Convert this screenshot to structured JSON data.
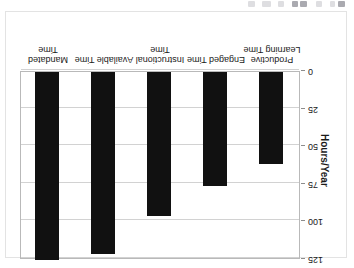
{
  "toolbar": {
    "visible": true,
    "note": "partially cropped application toolbar strip",
    "icons": [
      {
        "name": "toolbar-icon-1",
        "x": 248,
        "w": 7,
        "dark": false
      },
      {
        "name": "toolbar-icon-2",
        "x": 262,
        "w": 9,
        "dark": false
      },
      {
        "name": "toolbar-icon-3",
        "x": 278,
        "w": 6,
        "dark": false
      },
      {
        "name": "toolbar-icon-4",
        "x": 292,
        "w": 6,
        "dark": true
      },
      {
        "name": "toolbar-icon-5",
        "x": 300,
        "w": 7,
        "dark": true
      },
      {
        "name": "toolbar-icon-6",
        "x": 316,
        "w": 6,
        "dark": false
      },
      {
        "name": "toolbar-icon-7",
        "x": 330,
        "w": 5,
        "dark": false
      },
      {
        "name": "toolbar-icon-8",
        "x": 338,
        "w": 7,
        "dark": true
      }
    ]
  },
  "colors": {
    "bar": "#111111",
    "gridline": "#d2d2d2",
    "frame": "#b9b9b9",
    "card_border": "#e3e3e3",
    "background": "#ffffff",
    "text": "#1a1a1a"
  },
  "orientation": {
    "rotation_degrees": 180,
    "description": "Entire chart is rendered upside down (rotated 180 degrees)"
  },
  "chart_data": {
    "type": "bar",
    "title": "",
    "xlabel": "",
    "ylabel": "Hours/Year",
    "categories": [
      "Mandated Time",
      "Available Time",
      "Instructional Time",
      "Engaged Time",
      "Productive Learning Time"
    ],
    "values": [
      126,
      121,
      96,
      76,
      61
    ],
    "ylim": [
      0,
      125
    ],
    "yticks": [
      0,
      25,
      50,
      75,
      100,
      125
    ],
    "ytick_labels": [
      "0",
      "25",
      "50",
      "75",
      "100",
      "125"
    ],
    "y_axis_inverted": true,
    "grid": true,
    "legend": false,
    "legend_position": "none"
  }
}
